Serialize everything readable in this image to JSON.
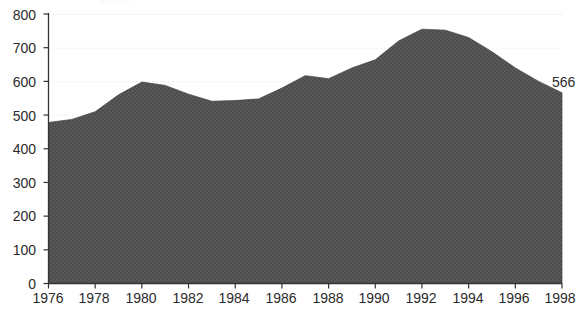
{
  "chart_data": {
    "type": "area",
    "title": "",
    "subtitle": "",
    "xlabel": "",
    "ylabel": "",
    "x": [
      1976,
      1977,
      1978,
      1979,
      1980,
      1981,
      1982,
      1983,
      1984,
      1985,
      1986,
      1987,
      1988,
      1989,
      1990,
      1991,
      1992,
      1993,
      1994,
      1995,
      1996,
      1997,
      1998
    ],
    "values": [
      478,
      487,
      510,
      560,
      598,
      588,
      562,
      541,
      543,
      548,
      580,
      617,
      608,
      640,
      664,
      720,
      755,
      752,
      730,
      688,
      640,
      600,
      566
    ],
    "series": [
      {
        "name": "",
        "values": [
          478,
          487,
          510,
          560,
          598,
          588,
          562,
          541,
          543,
          548,
          580,
          617,
          608,
          640,
          664,
          720,
          755,
          752,
          730,
          688,
          640,
          600,
          566
        ]
      }
    ],
    "xlim": [
      1976,
      1998
    ],
    "ylim": [
      0,
      800
    ],
    "xticks": [
      1976,
      1978,
      1980,
      1982,
      1984,
      1986,
      1988,
      1990,
      1992,
      1994,
      1996,
      1998
    ],
    "yticks": [
      0,
      100,
      200,
      300,
      400,
      500,
      600,
      700,
      800
    ],
    "grid": "horizontal-dotted-faint",
    "legend": "none",
    "annotations": [
      {
        "label": "566",
        "x": 1998,
        "y": 566
      }
    ],
    "fill_color": "#575757",
    "fill_pattern": "checkered-dither",
    "axis_color": "#333333",
    "grid_color": "#eeeeee"
  },
  "axes": {
    "y_tick_labels": [
      "800",
      "700",
      "600",
      "500",
      "400",
      "300",
      "200",
      "100",
      "0"
    ],
    "x_tick_labels": [
      "1976",
      "1978",
      "1980",
      "1982",
      "1984",
      "1986",
      "1988",
      "1990",
      "1992",
      "1994",
      "1996",
      "1998"
    ]
  },
  "annotation": {
    "end_value_label": "566"
  },
  "top_edge_remnant": "= ~ -- -  ,  -"
}
